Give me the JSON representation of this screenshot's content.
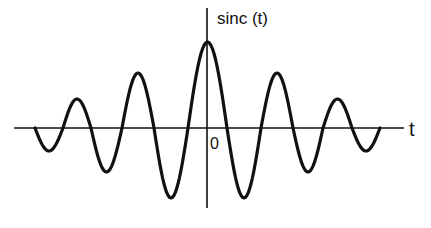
{
  "chart_data": {
    "type": "line",
    "title": "",
    "function": "sinc(t)",
    "ylabel": "sinc (t)",
    "xlabel": "t",
    "origin_label": "0",
    "grid": false,
    "legend": null,
    "axes": {
      "x_axis_px": {
        "x1": 14,
        "x2": 404,
        "y": 128
      },
      "y_axis_px": {
        "x": 207,
        "y1": 8,
        "y2": 208
      }
    },
    "lobes_px": [
      {
        "x0": 35,
        "x1": 63,
        "extreme_y": 151
      },
      {
        "x0": 63,
        "x1": 91,
        "extreme_y": 99
      },
      {
        "x0": 91,
        "x1": 122,
        "extreme_y": 172
      },
      {
        "x0": 122,
        "x1": 154,
        "extreme_y": 73
      },
      {
        "x0": 154,
        "x1": 188,
        "extreme_y": 198
      },
      {
        "x0": 188,
        "x1": 227,
        "extreme_y": 42
      },
      {
        "x0": 227,
        "x1": 261,
        "extreme_y": 198
      },
      {
        "x0": 261,
        "x1": 293,
        "extreme_y": 73
      },
      {
        "x0": 293,
        "x1": 323,
        "extreme_y": 172
      },
      {
        "x0": 323,
        "x1": 352,
        "extreme_y": 99
      },
      {
        "x0": 352,
        "x1": 380,
        "extreme_y": 151
      }
    ],
    "lobe_relative_amplitudes": [
      -0.26,
      0.34,
      -0.5,
      0.63,
      -0.8,
      1.0,
      -0.8,
      0.63,
      -0.5,
      0.34,
      -0.26
    ],
    "stroke_color": "#111111"
  },
  "labels": {
    "ylabel": "sinc (t)",
    "xlabel": "t",
    "origin": "0"
  }
}
